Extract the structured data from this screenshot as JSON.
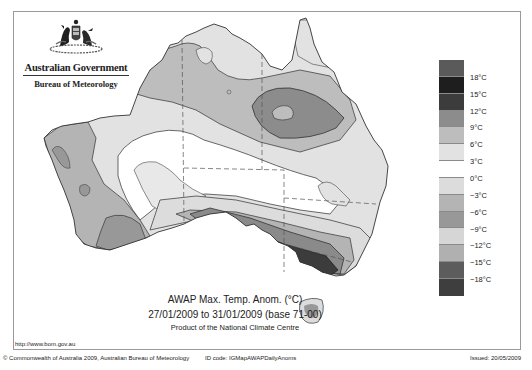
{
  "header": {
    "government": "Australian Government",
    "agency": "Bureau of Meteorology",
    "emblem_icon": "coat-of-arms-icon"
  },
  "map": {
    "title": "AWAP Max. Temp. Anom. (°C)",
    "period": "27/01/2009 to 31/01/2009 (base 71-00)",
    "product": "Product of the National Climate Centre",
    "region": "Australia"
  },
  "legend": {
    "boxes": [
      {
        "color": "#5a5a5a"
      },
      {
        "color": "#1e1e1e"
      },
      {
        "color": "#3c3c3c"
      },
      {
        "color": "#8c8c8c"
      },
      {
        "color": "#bdbdbd"
      },
      {
        "color": "#e2e2e2"
      },
      {
        "color": "#ffffff"
      },
      {
        "color": "#dcdcdc"
      },
      {
        "color": "#b4b4b4"
      },
      {
        "color": "#989898"
      },
      {
        "color": "#d6d6d6"
      },
      {
        "color": "#b0b0b0"
      },
      {
        "color": "#5c5c5c"
      },
      {
        "color": "#3e3e3e"
      }
    ],
    "labels": [
      "18°C",
      "15°C",
      "12°C",
      "9°C",
      "6°C",
      "3°C",
      "0°C",
      "−3°C",
      "−6°C",
      "−9°C",
      "−12°C",
      "−15°C",
      "−18°C"
    ]
  },
  "footer": {
    "url": "http://www.bom.gov.au",
    "copyright": "© Commonwealth of Australia 2009, Australian Bureau of Meteorology",
    "id_code": "ID code: IGMapAWAPDailyAnoms",
    "issued": "Issued: 20/05/2009"
  },
  "colors": {
    "frame": "#9a9a9a",
    "coast": "#333333",
    "contour": "#444444"
  }
}
